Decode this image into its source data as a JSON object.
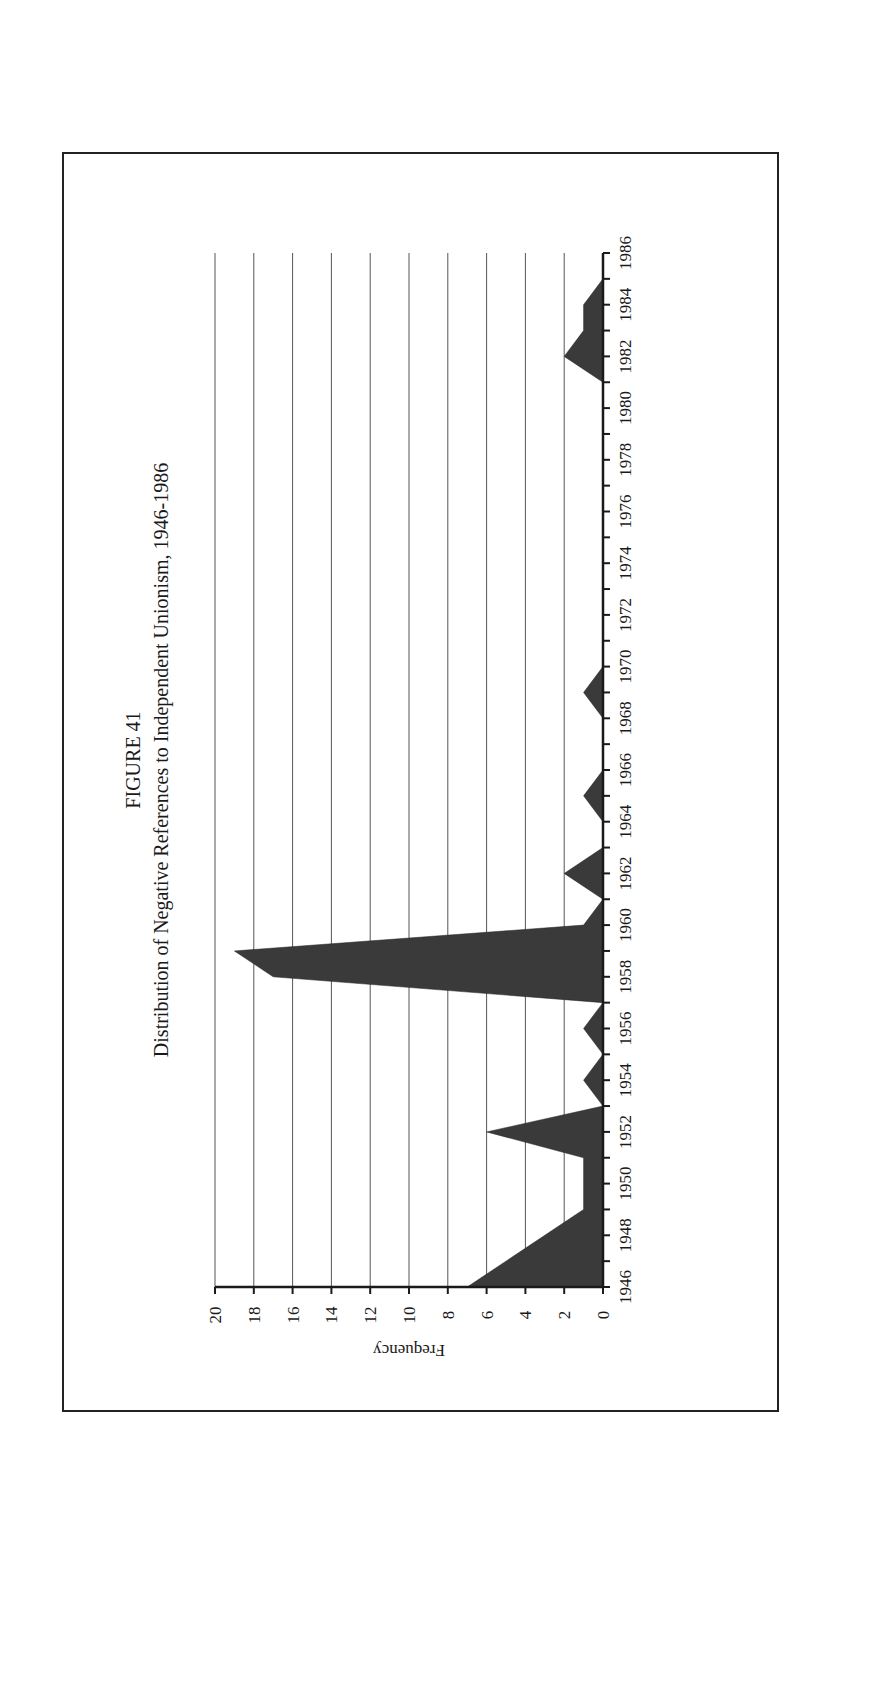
{
  "figure": {
    "label": "FIGURE 41",
    "title": "Distribution of Negative References to Independent Unionism, 1946-1986"
  },
  "axes": {
    "y_title": "Frequency",
    "y_ticks": [
      "0",
      "2",
      "4",
      "6",
      "8",
      "10",
      "12",
      "14",
      "16",
      "18",
      "20"
    ],
    "x_tick_labels": [
      "1946",
      "1948",
      "1950",
      "1952",
      "1954",
      "1956",
      "1958",
      "1960",
      "1962",
      "1964",
      "1966",
      "1968",
      "1970",
      "1972",
      "1974",
      "1976",
      "1978",
      "1980",
      "1982",
      "1984",
      "1986"
    ]
  },
  "colors": {
    "fill": "#3a3a3a",
    "grid": "#555555",
    "axis": "#1a1a1a",
    "border": "#222222"
  },
  "chart_data": {
    "type": "area",
    "title": "Distribution of Negative References to Independent Unionism, 1946-1986",
    "subtitle": "FIGURE 41",
    "xlabel": "",
    "ylabel": "Frequency",
    "ylim": [
      0,
      20
    ],
    "xlim": [
      1946,
      1986
    ],
    "grid": true,
    "orientation": "rotated -90 degrees on page",
    "x": [
      1946,
      1947,
      1948,
      1949,
      1950,
      1951,
      1952,
      1953,
      1954,
      1955,
      1956,
      1957,
      1958,
      1959,
      1960,
      1961,
      1962,
      1963,
      1964,
      1965,
      1966,
      1967,
      1968,
      1969,
      1970,
      1971,
      1972,
      1973,
      1974,
      1975,
      1976,
      1977,
      1978,
      1979,
      1980,
      1981,
      1982,
      1983,
      1984,
      1985,
      1986
    ],
    "series": [
      {
        "name": "Negative references",
        "values": [
          7,
          5,
          3,
          1,
          1,
          1,
          6,
          0,
          1,
          0,
          1,
          0,
          17,
          19,
          1,
          0,
          2,
          0,
          0,
          1,
          0,
          0,
          0,
          1,
          0,
          0,
          0,
          0,
          0,
          0,
          0,
          0,
          0,
          0,
          0,
          0,
          2,
          1,
          1,
          0,
          0
        ]
      }
    ]
  }
}
